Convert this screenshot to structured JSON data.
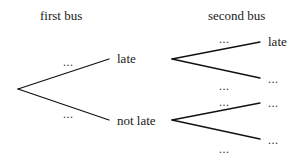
{
  "headers": {
    "first": "first bus",
    "second": "second bus"
  },
  "first_bus": {
    "branches": [
      {
        "outcome": "late",
        "probability": "..."
      },
      {
        "outcome": "not late",
        "probability": "..."
      }
    ]
  },
  "second_bus": {
    "after_late": [
      {
        "outcome": "late",
        "probability": "..."
      },
      {
        "outcome": "...",
        "probability": "..."
      }
    ],
    "after_not_late": [
      {
        "outcome": "...",
        "probability": "..."
      },
      {
        "outcome": "...",
        "probability": "..."
      }
    ]
  },
  "colors": {
    "line": "#111111",
    "text": "#1a1a1a"
  }
}
